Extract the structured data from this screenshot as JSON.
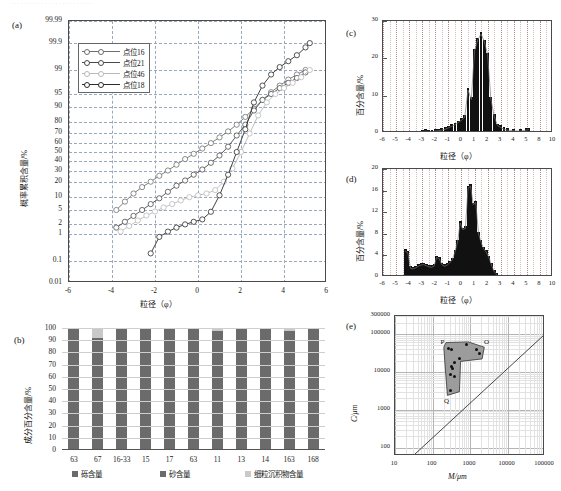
{
  "figure": {
    "top_artifact_text": "",
    "background": "#ffffff"
  },
  "panels": {
    "a": {
      "tag": "(a)",
      "ylabel": "概率累积含量/%",
      "xlabel": "粒径（φ）",
      "yticks": [
        "99.99",
        "99.9",
        "99",
        "95",
        "90",
        "80",
        "70",
        "60",
        "50",
        "40",
        "30",
        "20",
        "10",
        "5",
        "2",
        "1",
        "0.1",
        "0.01"
      ],
      "xticks": [
        "-6",
        "-4",
        "-2",
        "0",
        "2",
        "4",
        "6"
      ],
      "legend": [
        {
          "label": "点位16",
          "color": "#6e6e6e"
        },
        {
          "label": "点位21",
          "color": "#4a4a4a"
        },
        {
          "label": "点位46",
          "color": "#b9b9b9"
        },
        {
          "label": "点位18",
          "color": "#2b2b2b"
        }
      ]
    },
    "b": {
      "tag": "(b)",
      "ylabel": "成分百分含量/%",
      "yticks": [
        "100",
        "90",
        "80",
        "70",
        "60",
        "50",
        "40",
        "30",
        "20",
        "10",
        "0"
      ],
      "categories": [
        "63",
        "67",
        "16-33",
        "15",
        "17",
        "63",
        "11",
        "13",
        "14",
        "163",
        "168"
      ],
      "legend": [
        {
          "label": "砾含量",
          "color": "#6b6b6b"
        },
        {
          "label": "砂含量",
          "color": "#6b6b6b"
        },
        {
          "label": "细粒沉积物含量",
          "color": "#c9c9c9"
        }
      ]
    },
    "c": {
      "tag": "(c)",
      "ylabel": "百分含量/%",
      "xlabel": "粒径（φ）",
      "yticks": [
        "30",
        "20",
        "10",
        "0"
      ],
      "xticks": [
        "-6",
        "-5",
        "-4",
        "-3",
        "-2",
        "-1",
        "0",
        "1",
        "2",
        "3",
        "4",
        "5",
        "8",
        "10"
      ]
    },
    "d": {
      "tag": "(d)",
      "ylabel": "百分含量/%",
      "xlabel": "粒径（φ）",
      "yticks": [
        "20",
        "16",
        "12",
        "8",
        "4",
        "0"
      ],
      "xticks": [
        "-6",
        "-5",
        "-4",
        "-3",
        "-2",
        "-1",
        "0",
        "1",
        "2",
        "3",
        "4",
        "5",
        "8",
        "10"
      ]
    },
    "e": {
      "tag": "(e)",
      "ylabel": "C/μm",
      "xlabel": "M/μm",
      "yticks": [
        "300000",
        "100000",
        "10000",
        "1000",
        "100"
      ],
      "xticks": [
        "10",
        "100",
        "1000",
        "10000",
        "100000"
      ],
      "point_labels": [
        "P",
        "O",
        "Q"
      ]
    }
  },
  "chart_data": [
    {
      "id": "a",
      "type": "line",
      "title": "",
      "xlabel": "粒径（φ）",
      "ylabel": "概率累积含量/%",
      "xlim": [
        -6,
        6
      ],
      "ylim_probability": [
        0.01,
        99.99
      ],
      "grid": true,
      "legend_position": "upper-left",
      "series": [
        {
          "name": "点位16",
          "color": "#6e6e6e",
          "x": [
            -3.8,
            -3.4,
            -3.0,
            -2.6,
            -2.2,
            -1.8,
            -1.4,
            -1.0,
            -0.6,
            -0.2,
            0.2,
            0.6,
            1.0,
            1.4,
            1.8,
            2.2,
            2.6,
            3.0,
            3.4,
            3.8,
            4.2,
            4.6,
            5.0
          ],
          "y": [
            5,
            8,
            12,
            16,
            20,
            25,
            30,
            36,
            42,
            48,
            54,
            60,
            66,
            72,
            78,
            84,
            89,
            93,
            95.5,
            97,
            98,
            98.6,
            99
          ]
        },
        {
          "name": "点位21",
          "color": "#4a4a4a",
          "x": [
            -3.8,
            -3.4,
            -3.0,
            -2.6,
            -2.2,
            -1.8,
            -1.4,
            -1.0,
            -0.6,
            -0.2,
            0.2,
            0.6,
            1.0,
            1.4,
            1.8,
            2.2,
            2.6,
            3.0,
            3.4,
            3.8,
            4.2,
            4.6,
            5.0
          ],
          "y": [
            1.6,
            2.4,
            3.5,
            5,
            7,
            9.5,
            13,
            17,
            21,
            26,
            31,
            38,
            46,
            56,
            68,
            78,
            88,
            93,
            95,
            96.5,
            97.5,
            98.2,
            98.8
          ]
        },
        {
          "name": "点位46",
          "color": "#b9b9b9",
          "x": [
            -3.6,
            -3.2,
            -2.8,
            -2.4,
            -2.0,
            -1.6,
            -1.2,
            -0.8,
            -0.4,
            0.0,
            0.4,
            0.8,
            1.2,
            1.6,
            2.0,
            2.4,
            2.8,
            3.2,
            3.6,
            4.0,
            4.4,
            4.8,
            5.2
          ],
          "y": [
            1.2,
            1.8,
            2.6,
            3.6,
            4.6,
            5.8,
            7,
            8.5,
            10,
            11,
            12,
            14,
            20,
            32,
            50,
            70,
            85,
            92,
            95,
            96.5,
            97.5,
            98.3,
            99
          ]
        },
        {
          "name": "点位18",
          "color": "#2b2b2b",
          "x": [
            -2.2,
            -1.8,
            -1.4,
            -1.0,
            -0.6,
            -0.2,
            0.2,
            0.6,
            1.0,
            1.4,
            1.8,
            2.2,
            2.6,
            3.0,
            3.4,
            3.8,
            4.2,
            4.6,
            5.0,
            5.2
          ],
          "y": [
            0.2,
            0.8,
            1.2,
            1.6,
            2.0,
            2.4,
            2.8,
            4.5,
            11,
            26,
            50,
            74,
            92,
            97,
            98.6,
            99.2,
            99.5,
            99.7,
            99.85,
            99.9
          ]
        }
      ]
    },
    {
      "id": "b",
      "type": "bar",
      "stacked": true,
      "title": "",
      "xlabel": "",
      "ylabel": "成分百分含量/%",
      "ylim": [
        0,
        100
      ],
      "grid": true,
      "categories": [
        "63",
        "67",
        "16-33",
        "15",
        "17",
        "63",
        "11",
        "13",
        "14",
        "163",
        "168"
      ],
      "series": [
        {
          "name": "砾含量",
          "color": "#6b6b6b",
          "values": [
            98,
            91,
            99,
            99,
            98,
            98.5,
            97,
            98,
            99.5,
            97,
            98.5
          ]
        },
        {
          "name": "砂含量",
          "color": "#6b6b6b",
          "values": [
            0,
            0,
            0,
            0,
            0,
            0,
            0,
            0,
            0,
            0,
            0
          ]
        },
        {
          "name": "细粒沉积物含量",
          "color": "#c9c9c9",
          "values": [
            2,
            9,
            1,
            1,
            2,
            1.5,
            3,
            2,
            0.5,
            3,
            1.5
          ]
        }
      ]
    },
    {
      "id": "c",
      "type": "bar",
      "title": "",
      "xlabel": "粒径（φ）",
      "ylabel": "百分含量/%",
      "ylim": [
        0,
        30
      ],
      "xlim": [
        -6,
        10
      ],
      "grid": true,
      "x": [
        -3.0,
        -2.75,
        -2.5,
        -2.25,
        -2.0,
        -1.75,
        -1.5,
        -1.25,
        -1.0,
        -0.75,
        -0.5,
        -0.25,
        0.0,
        0.25,
        0.5,
        0.75,
        1.0,
        1.25,
        1.5,
        1.75,
        2.0,
        2.25,
        2.5,
        2.75,
        3.0,
        3.25,
        3.5,
        4.0,
        4.5,
        5.0,
        5.5
      ],
      "values": [
        0.4,
        0.5,
        0.4,
        0.3,
        0.5,
        0.6,
        0.8,
        1.0,
        1.4,
        1.8,
        2.2,
        2.8,
        3.4,
        4.2,
        11.5,
        9.0,
        22.0,
        25.0,
        26.5,
        24.5,
        21.0,
        9.0,
        4.5,
        2.0,
        1.5,
        1.0,
        0.8,
        0.6,
        0.5,
        0.8,
        0.9
      ]
    },
    {
      "id": "d",
      "type": "bar",
      "title": "",
      "xlabel": "粒径（φ）",
      "ylabel": "百分含量/%",
      "ylim": [
        0,
        20
      ],
      "xlim": [
        -6,
        10
      ],
      "grid": true,
      "x": [
        -4.3,
        -4.1,
        -3.9,
        -3.7,
        -3.5,
        -3.3,
        -3.1,
        -2.9,
        -2.7,
        -2.5,
        -2.3,
        -2.1,
        -1.9,
        -1.7,
        -1.5,
        -1.3,
        -1.1,
        -0.9,
        -0.7,
        -0.5,
        -0.3,
        -0.1,
        0.1,
        0.3,
        0.5,
        0.7,
        0.9,
        1.1,
        1.3,
        1.5,
        1.7,
        1.9,
        2.1,
        2.3,
        2.5,
        2.7
      ],
      "values": [
        4.8,
        4.5,
        1.6,
        1.5,
        1.7,
        2.0,
        2.2,
        2.3,
        2.1,
        1.9,
        1.8,
        2.0,
        3.6,
        3.4,
        2.3,
        2.0,
        2.2,
        2.6,
        3.2,
        4.6,
        6.4,
        10.0,
        8.8,
        9.0,
        16.4,
        16.8,
        13.4,
        13.8,
        8.0,
        6.4,
        5.2,
        4.6,
        3.6,
        2.2,
        1.0,
        0.4
      ]
    },
    {
      "id": "e",
      "type": "scatter",
      "title": "",
      "xlabel": "M/μm",
      "ylabel": "C/μm",
      "xscale": "log",
      "yscale": "log",
      "xlim": [
        10,
        100000
      ],
      "ylim": [
        60,
        300000
      ],
      "grid": true,
      "annotations": [
        "P",
        "O",
        "Q"
      ],
      "points": [
        {
          "x": 260,
          "y": 42000
        },
        {
          "x": 330,
          "y": 40000
        },
        {
          "x": 800,
          "y": 52000
        },
        {
          "x": 1500,
          "y": 40000
        },
        {
          "x": 1800,
          "y": 30000
        },
        {
          "x": 520,
          "y": 22000
        },
        {
          "x": 380,
          "y": 18000
        },
        {
          "x": 330,
          "y": 14000
        },
        {
          "x": 340,
          "y": 12500
        },
        {
          "x": 300,
          "y": 8500
        },
        {
          "x": 380,
          "y": 7500
        },
        {
          "x": 300,
          "y": 3200
        }
      ]
    }
  ]
}
